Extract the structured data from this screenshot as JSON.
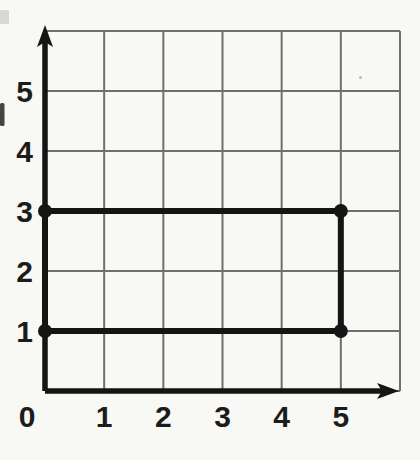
{
  "figure": {
    "background_color": "#f8f8f5"
  },
  "chart_data": {
    "type": "line",
    "title": "",
    "xlabel": "",
    "ylabel": "",
    "xlim": [
      0,
      6
    ],
    "ylim": [
      0,
      6
    ],
    "x_ticks": [
      0,
      1,
      2,
      3,
      4,
      5
    ],
    "y_ticks": [
      1,
      2,
      3,
      4,
      5
    ],
    "grid": true,
    "legend": false,
    "colors": {
      "grid_line": "#6f6f6c",
      "axis": "#151515",
      "shape": "#151515",
      "vertex_dot": "#151515",
      "tick_label": "#1c1c1c"
    },
    "series": [
      {
        "name": "rectangle",
        "type": "polygon",
        "closed": true,
        "points": [
          [
            0,
            1
          ],
          [
            5,
            1
          ],
          [
            5,
            3
          ],
          [
            0,
            3
          ]
        ]
      }
    ],
    "vertices": [
      [
        0,
        1
      ],
      [
        5,
        1
      ],
      [
        5,
        3
      ],
      [
        0,
        3
      ]
    ]
  },
  "scan_artifacts": [
    {
      "name": "left-edge-text-fragment",
      "x": 0,
      "y": 103,
      "width": 4.5,
      "height": 23,
      "color": "#30302c",
      "opacity": 0.9
    },
    {
      "name": "top-left-smudge",
      "x": 0,
      "y": 10,
      "width": 9,
      "height": 14,
      "color": "#b7b7b2",
      "opacity": 0.5
    },
    {
      "name": "paper-speck",
      "x": 359,
      "y": 76,
      "width": 3,
      "height": 3,
      "color": "#8f8f8a",
      "opacity": 0.6
    }
  ]
}
